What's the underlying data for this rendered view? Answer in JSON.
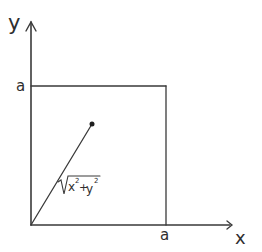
{
  "diagram": {
    "axes": {
      "x_label": "x",
      "y_label": "y"
    },
    "square": {
      "side_label_top": "a",
      "side_label_right": "a"
    },
    "segment": {
      "label_radical": "√",
      "label_x": "x",
      "label_x_exp": "2",
      "label_plus": "+",
      "label_y": "y",
      "label_y_exp": "2"
    },
    "colors": {
      "ink": "#3a3a3a",
      "background": "#ffffff"
    }
  }
}
